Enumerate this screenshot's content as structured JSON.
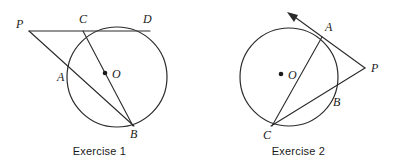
{
  "page": {
    "background_color": "#ffffff",
    "ink_color": "#2b2b2b",
    "width": 398,
    "height": 166
  },
  "figures": [
    {
      "id": "exercise-1",
      "caption": "Exercise 1",
      "circle": {
        "cx": 117,
        "cy": 77,
        "r": 50
      },
      "center_label": "O",
      "center_dot": {
        "x": 105,
        "y": 73
      },
      "center_label_pos": {
        "x": 112,
        "y": 77
      },
      "external_point": {
        "label": "P",
        "x": 29,
        "y": 31,
        "label_x": 16,
        "label_y": 28
      },
      "points": [
        {
          "label": "C",
          "x": 83,
          "y": 31,
          "label_x": 79,
          "label_y": 23
        },
        {
          "label": "D",
          "x": 146,
          "y": 31,
          "label_x": 143,
          "label_y": 23
        },
        {
          "label": "A",
          "x": 69,
          "y": 76,
          "label_x": 57,
          "label_y": 81
        },
        {
          "label": "B",
          "x": 132,
          "y": 125,
          "label_x": 130,
          "label_y": 138
        }
      ],
      "lines": [
        {
          "name": "secant-p-c-d",
          "from": "P",
          "to": "D"
        },
        {
          "name": "secant-p-a-b",
          "from": "P",
          "to": "B"
        },
        {
          "name": "chord-c-b",
          "from": "C",
          "to": "B"
        }
      ]
    },
    {
      "id": "exercise-2",
      "caption": "Exercise 2",
      "circle": {
        "cx": 90,
        "cy": 77,
        "r": 49
      },
      "center_label": "O",
      "center_dot": {
        "x": 82,
        "y": 74
      },
      "center_label_pos": {
        "x": 89,
        "y": 78
      },
      "external_point": {
        "label": "P",
        "x": 166,
        "y": 68,
        "label_x": 172,
        "label_y": 72
      },
      "points": [
        {
          "label": "A",
          "x": 123,
          "y": 37,
          "label_x": 126,
          "label_y": 30
        },
        {
          "label": "B",
          "x": 131,
          "y": 94,
          "label_x": 134,
          "label_y": 105
        },
        {
          "label": "C",
          "x": 73,
          "y": 125,
          "label_x": 66,
          "label_y": 138
        }
      ],
      "ray": {
        "name": "ray-p-a-arrow",
        "from": "P",
        "through": "A",
        "arrow_tip": {
          "x": 89,
          "y": 13
        }
      },
      "lines": [
        {
          "name": "secant-p-b-c",
          "from": "P",
          "to": "C"
        },
        {
          "name": "chord-a-c",
          "from": "A",
          "to": "C"
        }
      ]
    }
  ]
}
